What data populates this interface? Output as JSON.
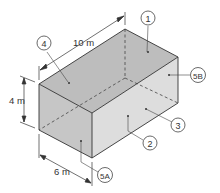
{
  "diagram": {
    "type": "isometric-box-room",
    "dimensions": {
      "length": "10 m",
      "height": "4 m",
      "width": "6 m"
    },
    "callouts": [
      {
        "id": "1",
        "label": "1",
        "surface": "top"
      },
      {
        "id": "2",
        "label": "2",
        "surface": "front-long-wall"
      },
      {
        "id": "3",
        "label": "3",
        "surface": "back-long-wall"
      },
      {
        "id": "4",
        "label": "4",
        "surface": "ceiling-near"
      },
      {
        "id": "5A",
        "label": "5A",
        "surface": "front-short-wall"
      },
      {
        "id": "5B",
        "label": "5B",
        "surface": "back-short-wall"
      }
    ],
    "colors": {
      "top_face": "#b9b9b9",
      "left_face": "#c4c4c4",
      "right_face": "#dcdcdc",
      "edge": "#333333"
    }
  }
}
